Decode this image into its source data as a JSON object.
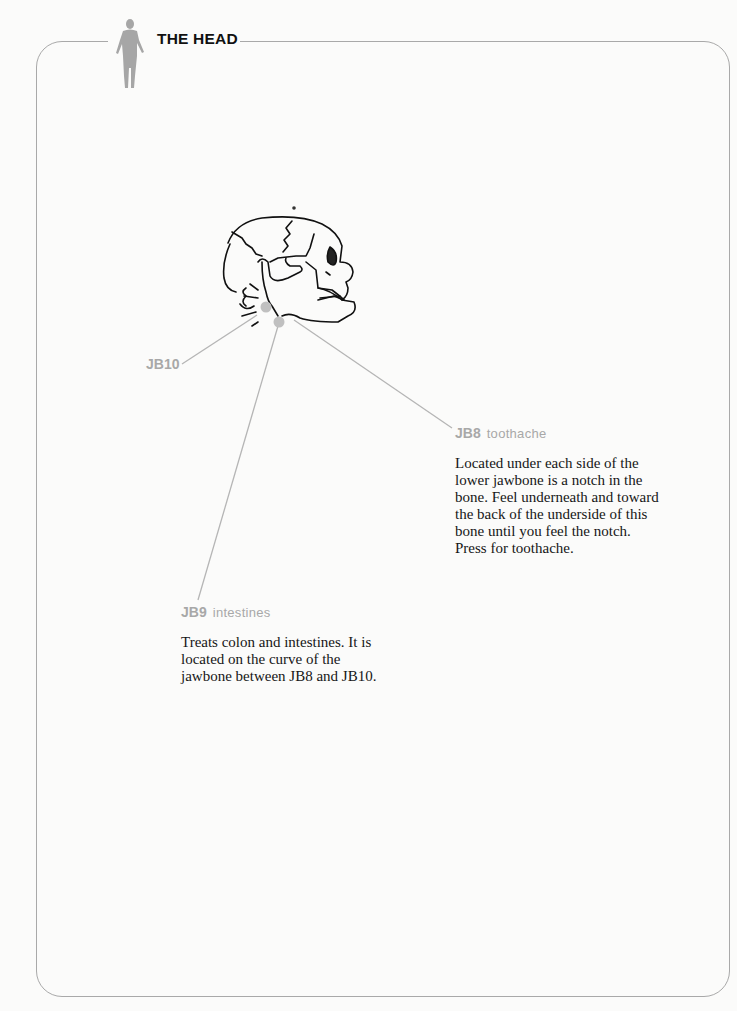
{
  "section": {
    "title": "THE HEAD",
    "icon": "human-figure-icon"
  },
  "diagram": {
    "image": "skull-side-view",
    "points": [
      {
        "code": "JB10",
        "name": ""
      },
      {
        "code": "JB8",
        "name": "toothache"
      },
      {
        "code": "JB9",
        "name": "intestines"
      }
    ]
  },
  "descriptions": {
    "jb8": [
      "Located under each side of the",
      "lower jawbone is a notch in the",
      "bone. Feel underneath and toward",
      "the back of the underside of this",
      "bone until you feel the notch.",
      "Press for toothache."
    ],
    "jb9": [
      "Treats colon and intestines. It is",
      "located on the curve of the",
      "jawbone between JB8 and JB10."
    ]
  },
  "colors": {
    "label_gray": "#a8a8a8",
    "leader_line": "#b5b5b5",
    "point_dot": "#bdbdbd",
    "frame": "#a9a9a9"
  }
}
